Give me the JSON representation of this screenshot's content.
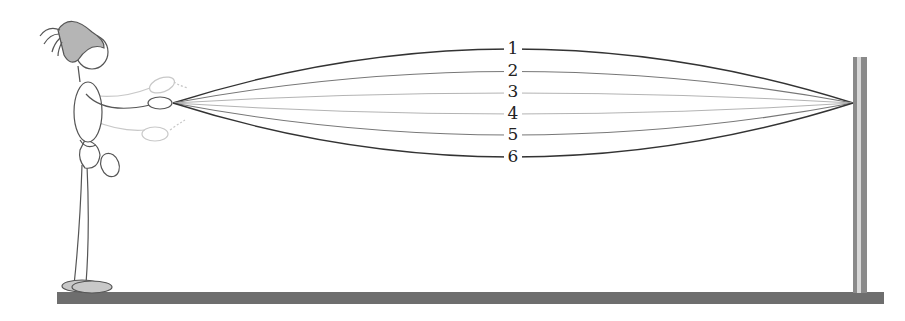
{
  "figure": {
    "string_labels": [
      "1",
      "2",
      "3",
      "4",
      "5",
      "6"
    ],
    "colors": {
      "ground": "#6e6e6e",
      "post": "#8a8a8a",
      "outer_string": "#333333",
      "inner_string": "#9a9a9a",
      "hat": "#b5b5b5",
      "outline": "#555555"
    }
  }
}
